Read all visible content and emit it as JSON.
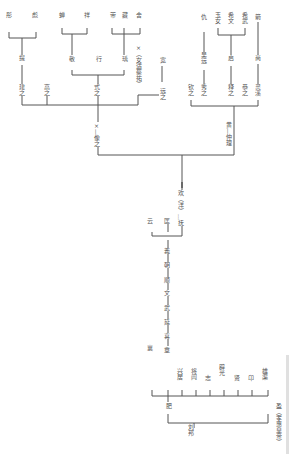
{
  "diagram": {
    "type": "genealogy-tree",
    "orientation": "rotated-90",
    "line_color": "#555555",
    "root": "刘邦",
    "nodes": {
      "liubang": "刘邦",
      "fei": "肥",
      "ying": "盈（孝惠皇帝）",
      "xiang": "襄",
      "zhang": "章",
      "xingju": "兴居",
      "jianglu": "将闾",
      "zhi": "志",
      "piguang": "辟光",
      "xian": "贤",
      "ang": "卬",
      "xiongqu": "雄渠",
      "xi": "喜",
      "yan": "延",
      "wu": "武",
      "wen": "文",
      "shun": "顺",
      "chao": "朝",
      "yi": "義",
      "yun": "云",
      "kuang": "匡",
      "huan": "欢（洋）…抚",
      "x_xiang": "×—像之",
      "x_main": "×",
      "yi_wei": "×（女适蔡祐）",
      "huang_zhongli": "黄—仲理",
      "jian_zhi": "建之",
      "gao_zhi": "高之",
      "shi_zhi": "式之",
      "qing_zhi": "庆之",
      "ti": "提",
      "gong": "恭",
      "xiu_left": "彤",
      "chu": "彪",
      "jing": "敬",
      "xing": "行",
      "chuan": "畴",
      "cheng": "蝉",
      "zhao": "祥",
      "zeng": "带",
      "xuan": "藏",
      "she": "舍",
      "yuan_zhi": "远之",
      "yuan_child": "宽",
      "qin_zhi": "钦之",
      "xiu_zhi": "秀之",
      "wu_yan": "吴远",
      "chou": "仇",
      "shi2_zhi": "释之",
      "qi": "启",
      "yu_nu": "玉女",
      "xi_wen": "希文",
      "xi_wu": "希武",
      "yin_zhi": "恭之",
      "ling_xi": "灵溪",
      "shang": "尚",
      "jian": "箭"
    }
  },
  "chart_data": {
    "type": "tree",
    "title": "",
    "edges": [
      [
        "刘邦",
        "肥"
      ],
      [
        "刘邦",
        "盈（孝惠皇帝）"
      ],
      [
        "肥",
        "襄"
      ],
      [
        "肥",
        "章"
      ],
      [
        "肥",
        "兴居"
      ],
      [
        "肥",
        "将闾"
      ],
      [
        "肥",
        "志"
      ],
      [
        "肥",
        "辟光"
      ],
      [
        "肥",
        "贤"
      ],
      [
        "肥",
        "卬"
      ],
      [
        "肥",
        "雄渠"
      ],
      [
        "章",
        "喜"
      ],
      [
        "喜",
        "延"
      ],
      [
        "延",
        "武"
      ],
      [
        "武",
        "文"
      ],
      [
        "文",
        "顺"
      ],
      [
        "顺",
        "朝"
      ],
      [
        "朝",
        "義"
      ],
      [
        "朝",
        "云"
      ],
      [
        "朝",
        "匡"
      ],
      [
        "匡",
        "欢（洋）…抚"
      ],
      [
        "欢（洋）…抚",
        "×—像之"
      ],
      [
        "欢（洋）…抚",
        "黄—仲理"
      ],
      [
        "×—像之",
        "建之"
      ],
      [
        "×—像之",
        "高之"
      ],
      [
        "×—像之",
        "式之"
      ],
      [
        "×—像之",
        "×（女适蔡祐）"
      ],
      [
        "×—像之",
        "远之"
      ],
      [
        "建之",
        "提"
      ],
      [
        "提",
        "彤"
      ],
      [
        "提",
        "彪"
      ],
      [
        "式之",
        "敬"
      ],
      [
        "式之",
        "行"
      ],
      [
        "式之",
        "瑀"
      ],
      [
        "敬",
        "蝉"
      ],
      [
        "敬",
        "祥"
      ],
      [
        "瑀",
        "带"
      ],
      [
        "瑀",
        "藏"
      ],
      [
        "瑀",
        "舍"
      ],
      [
        "远之",
        "宽"
      ],
      [
        "黄—仲理",
        "钦之"
      ],
      [
        "黄—仲理",
        "秀之"
      ],
      [
        "黄—仲理",
        "释之"
      ],
      [
        "黄—仲理",
        "恭之"
      ],
      [
        "黄—仲理",
        "灵溪"
      ],
      [
        "秀之",
        "吴远"
      ],
      [
        "吴远",
        "仇"
      ],
      [
        "释之",
        "启"
      ],
      [
        "启",
        "玉女"
      ],
      [
        "启",
        "希文"
      ],
      [
        "启",
        "希武"
      ],
      [
        "灵溪",
        "尚"
      ],
      [
        "尚",
        "箭"
      ]
    ]
  },
  "labels": [
    {
      "id": "liubang",
      "text": "刘邦",
      "x": 190,
      "y": 424
    },
    {
      "id": "fei",
      "text": "肥",
      "x": 168,
      "y": 403
    },
    {
      "id": "ying",
      "text": "盈（孝惠皇帝）",
      "x": 278,
      "y": 403
    },
    {
      "id": "xiang",
      "text": "襄",
      "x": 149,
      "y": 345
    },
    {
      "id": "zhang",
      "text": "章",
      "x": 166,
      "y": 347
    },
    {
      "id": "xingju",
      "text": "兴居",
      "x": 179,
      "y": 368
    },
    {
      "id": "jianglu",
      "text": "将闾",
      "x": 193,
      "y": 368
    },
    {
      "id": "zhi",
      "text": "志",
      "x": 207,
      "y": 375
    },
    {
      "id": "piguang",
      "text": "辟光",
      "x": 221,
      "y": 364
    },
    {
      "id": "xian",
      "text": "贤",
      "x": 236,
      "y": 375
    },
    {
      "id": "ang",
      "text": "卬",
      "x": 250,
      "y": 375
    },
    {
      "id": "xiongqu",
      "text": "雄渠",
      "x": 264,
      "y": 368
    },
    {
      "id": "xi",
      "text": "喜",
      "x": 166,
      "y": 333
    },
    {
      "id": "yan",
      "text": "延",
      "x": 166,
      "y": 319
    },
    {
      "id": "wu",
      "text": "武",
      "x": 166,
      "y": 305
    },
    {
      "id": "wen",
      "text": "文",
      "x": 166,
      "y": 290
    },
    {
      "id": "shun",
      "text": "顺",
      "x": 166,
      "y": 277
    },
    {
      "id": "chao",
      "text": "朝",
      "x": 166,
      "y": 262
    },
    {
      "id": "yi",
      "text": "義",
      "x": 166,
      "y": 248
    },
    {
      "id": "yun",
      "text": "云",
      "x": 149,
      "y": 218
    },
    {
      "id": "kuang",
      "text": "匡",
      "x": 166,
      "y": 218
    },
    {
      "id": "huan",
      "text": "欢（洋）…抚",
      "x": 180,
      "y": 190
    },
    {
      "id": "xxiang",
      "text": "×—像之",
      "x": 96,
      "y": 122
    },
    {
      "id": "huang",
      "text": "黄—仲理",
      "x": 228,
      "y": 122
    },
    {
      "id": "jianzhi",
      "text": "建之",
      "x": 21,
      "y": 84
    },
    {
      "id": "gaozhi",
      "text": "高之",
      "x": 46,
      "y": 84
    },
    {
      "id": "shizhi",
      "text": "式之",
      "x": 96,
      "y": 84
    },
    {
      "id": "xnv",
      "text": "×（女适蔡祐）",
      "x": 138,
      "y": 44
    },
    {
      "id": "yuanzhi",
      "text": "远之",
      "x": 162,
      "y": 88
    },
    {
      "id": "yuanchild",
      "text": "宽",
      "x": 162,
      "y": 57
    },
    {
      "id": "ti",
      "text": "提",
      "x": 21,
      "y": 55
    },
    {
      "id": "tong",
      "text": "彤",
      "x": 8,
      "y": 12
    },
    {
      "id": "biao",
      "text": "彪",
      "x": 34,
      "y": 12
    },
    {
      "id": "jing",
      "text": "敬",
      "x": 71,
      "y": 56
    },
    {
      "id": "xing",
      "text": "行",
      "x": 98,
      "y": 56
    },
    {
      "id": "yu",
      "text": "瑀",
      "x": 124,
      "y": 56
    },
    {
      "id": "chan",
      "text": "蝉",
      "x": 61,
      "y": 12
    },
    {
      "id": "xiang2",
      "text": "祥",
      "x": 86,
      "y": 12
    },
    {
      "id": "dai",
      "text": "带",
      "x": 112,
      "y": 12
    },
    {
      "id": "cang",
      "text": "藏",
      "x": 124,
      "y": 12
    },
    {
      "id": "she",
      "text": "舍",
      "x": 138,
      "y": 12
    },
    {
      "id": "qinzhi",
      "text": "钦之",
      "x": 190,
      "y": 84
    },
    {
      "id": "xiuzhi",
      "text": "秀之",
      "x": 203,
      "y": 84
    },
    {
      "id": "wuyuan",
      "text": "吴远",
      "x": 203,
      "y": 52
    },
    {
      "id": "chou",
      "text": "仇",
      "x": 203,
      "y": 14
    },
    {
      "id": "shizhi2",
      "text": "释之",
      "x": 230,
      "y": 84
    },
    {
      "id": "qi",
      "text": "启",
      "x": 230,
      "y": 55
    },
    {
      "id": "yunv",
      "text": "玉女",
      "x": 217,
      "y": 12
    },
    {
      "id": "xiwen",
      "text": "希文",
      "x": 230,
      "y": 12
    },
    {
      "id": "xiwu",
      "text": "希武",
      "x": 244,
      "y": 12
    },
    {
      "id": "gongzhi",
      "text": "恭之",
      "x": 244,
      "y": 84
    },
    {
      "id": "lingxi",
      "text": "灵溪",
      "x": 257,
      "y": 84
    },
    {
      "id": "shang",
      "text": "尚",
      "x": 257,
      "y": 55
    },
    {
      "id": "jian",
      "text": "箭",
      "x": 257,
      "y": 14
    }
  ]
}
